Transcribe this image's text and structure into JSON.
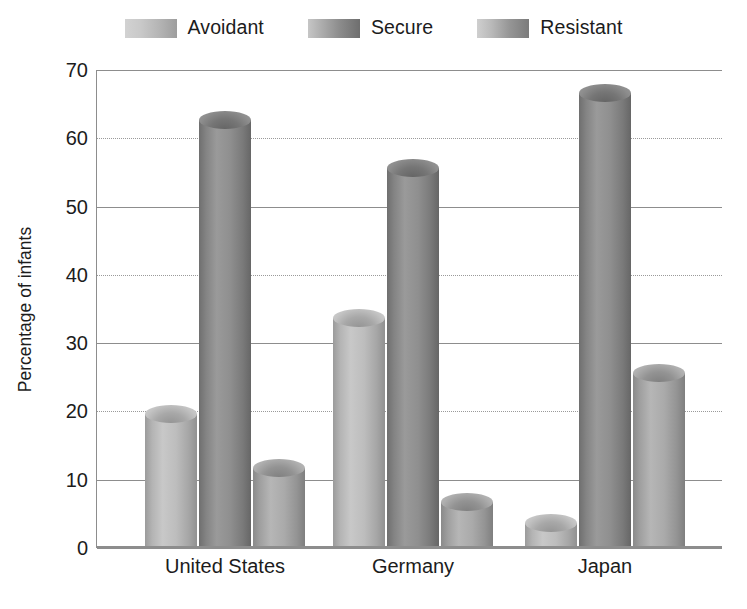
{
  "chart_data": {
    "type": "bar",
    "title": "",
    "subtitle": "",
    "xlabel": "",
    "ylabel": "Percentage of infants",
    "categories": [
      "United States",
      "Germany",
      "Japan"
    ],
    "series": [
      {
        "name": "Avoidant",
        "values": [
          21,
          35,
          5
        ]
      },
      {
        "name": "Secure",
        "values": [
          64,
          57,
          68
        ]
      },
      {
        "name": "Resistant",
        "values": [
          13,
          8,
          27
        ]
      }
    ],
    "ylim": [
      0,
      70
    ],
    "yticks": [
      0,
      10,
      20,
      30,
      40,
      50,
      60,
      70
    ],
    "ytick_labels": [
      "0",
      "10",
      "20",
      "30",
      "40",
      "50",
      "60",
      "70"
    ],
    "grid": true,
    "grid_axis": "y",
    "legend_position": "top-center",
    "bar_style": "cylinder-3d",
    "colors": {
      "avoidant": "#c8c8c8",
      "secure": "#8a8a8a",
      "resistant": "#b0b0b0",
      "gridline": "#8d8d8d",
      "axis": "#8d8d8d",
      "text": "#1c1c1c",
      "background": "#ffffff"
    }
  },
  "legend": {
    "items": [
      {
        "label": "Avoidant",
        "swatch": "swatch-avoidant-icon"
      },
      {
        "label": "Secure",
        "swatch": "swatch-secure-icon"
      },
      {
        "label": "Resistant",
        "swatch": "swatch-resistant-icon"
      }
    ]
  },
  "axes": {
    "y_title": "Percentage of infants",
    "y_labels": [
      "70",
      "60",
      "50",
      "40",
      "30",
      "20",
      "10",
      "0"
    ],
    "x_labels": [
      "United States",
      "Germany",
      "Japan"
    ]
  }
}
